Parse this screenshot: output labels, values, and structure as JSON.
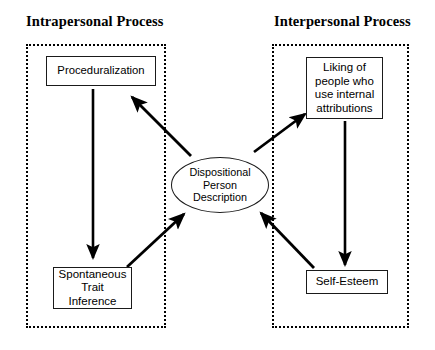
{
  "figure": {
    "type": "process-diagram",
    "background_color": "#ffffff",
    "line_color": "#000000"
  },
  "headings": {
    "left": "Intrapersonal Process",
    "right": "Interpersonal Process"
  },
  "nodes": {
    "proceduralization": {
      "label": "Proceduralization",
      "shape": "rectangle",
      "group": "intrapersonal"
    },
    "spontaneous_trait_inference": {
      "label": "Spontaneous\nTrait\nInference",
      "shape": "rectangle",
      "group": "intrapersonal"
    },
    "dispositional_person_description": {
      "label": "Dispositional\nPerson\nDescription",
      "shape": "ellipse",
      "group": "center"
    },
    "liking_of_people": {
      "label": "Liking of\npeople who\nuse internal\nattributions",
      "shape": "rectangle",
      "group": "interpersonal"
    },
    "self_esteem": {
      "label": "Self-Esteem",
      "shape": "rectangle",
      "group": "interpersonal"
    }
  },
  "edges": [
    {
      "id": "proceduralization-to-sti",
      "from": "proceduralization",
      "to": "spontaneous_trait_inference",
      "style": "solid-arrow"
    },
    {
      "id": "sti-to-dispositional",
      "from": "spontaneous_trait_inference",
      "to": "dispositional_person_description",
      "style": "solid-arrow"
    },
    {
      "id": "dispositional-to-proceduralization",
      "from": "dispositional_person_description",
      "to": "proceduralization",
      "style": "solid-arrow"
    },
    {
      "id": "dispositional-to-liking",
      "from": "dispositional_person_description",
      "to": "liking_of_people",
      "style": "solid-arrow"
    },
    {
      "id": "liking-to-self-esteem",
      "from": "liking_of_people",
      "to": "self_esteem",
      "style": "solid-arrow"
    },
    {
      "id": "self-esteem-to-dispositional",
      "from": "self_esteem",
      "to": "dispositional_person_description",
      "style": "solid-arrow"
    }
  ],
  "groups": {
    "intrapersonal": {
      "border_style": "dotted",
      "label": "Intrapersonal Process"
    },
    "interpersonal": {
      "border_style": "dotted",
      "label": "Interpersonal Process"
    }
  }
}
